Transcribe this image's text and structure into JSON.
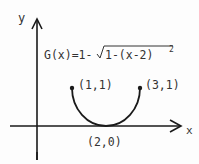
{
  "axes": {
    "x_label": "x",
    "y_label": "y"
  },
  "function": {
    "equation_prefix": "G(x)=1-",
    "radicand": "1-(x-2)",
    "exponent": "2"
  },
  "points": [
    {
      "label": "(1,1)",
      "role": "left-endpoint"
    },
    {
      "label": "(3,1)",
      "role": "right-endpoint"
    },
    {
      "label": "(2,0)",
      "role": "vertex"
    }
  ],
  "colors": {
    "ink": "#1a1a1a",
    "text": "#333333",
    "background": "#fdfdfd"
  }
}
